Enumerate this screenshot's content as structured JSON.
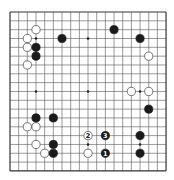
{
  "board": {
    "size": 19,
    "origin_x": 10,
    "origin_y": 12,
    "spacing_x": 8.67,
    "spacing_y": 8.83,
    "line_color": "#555555",
    "edge_color": "#333333",
    "background": "#ffffff",
    "star_points": [
      [
        3,
        3
      ],
      [
        9,
        3
      ],
      [
        15,
        3
      ],
      [
        3,
        9
      ],
      [
        9,
        9
      ],
      [
        15,
        9
      ],
      [
        3,
        15
      ],
      [
        9,
        15
      ],
      [
        15,
        15
      ]
    ]
  },
  "stones": [
    {
      "color": "white",
      "col": 3,
      "row": 2
    },
    {
      "color": "white",
      "col": 2,
      "row": 3
    },
    {
      "color": "black",
      "col": 6,
      "row": 3
    },
    {
      "color": "white",
      "col": 2,
      "row": 4
    },
    {
      "color": "black",
      "col": 3,
      "row": 4
    },
    {
      "color": "black",
      "col": 3,
      "row": 5
    },
    {
      "color": "white",
      "col": 2,
      "row": 6
    },
    {
      "color": "black",
      "col": 12,
      "row": 2
    },
    {
      "color": "black",
      "col": 15,
      "row": 3
    },
    {
      "color": "white",
      "col": 16,
      "row": 5
    },
    {
      "color": "white",
      "col": 14,
      "row": 9
    },
    {
      "color": "white",
      "col": 16,
      "row": 9
    },
    {
      "color": "black",
      "col": 16,
      "row": 11
    },
    {
      "color": "black",
      "col": 3,
      "row": 12
    },
    {
      "color": "black",
      "col": 5,
      "row": 12
    },
    {
      "color": "white",
      "col": 2,
      "row": 13
    },
    {
      "color": "white",
      "col": 3,
      "row": 13
    },
    {
      "color": "white",
      "col": 3,
      "row": 15
    },
    {
      "color": "black",
      "col": 5,
      "row": 15
    },
    {
      "color": "white",
      "col": 4,
      "row": 16
    },
    {
      "color": "black",
      "col": 5,
      "row": 16
    },
    {
      "color": "white",
      "col": 9,
      "row": 14,
      "label": "2"
    },
    {
      "color": "black",
      "col": 11,
      "row": 14,
      "label": "3"
    },
    {
      "color": "white",
      "col": 9,
      "row": 16
    },
    {
      "color": "black",
      "col": 11,
      "row": 16,
      "label": "1"
    },
    {
      "color": "black",
      "col": 15,
      "row": 14
    },
    {
      "color": "black",
      "col": 15,
      "row": 16
    }
  ]
}
